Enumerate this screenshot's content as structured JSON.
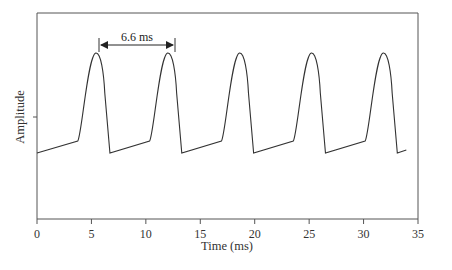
{
  "chart_data": {
    "type": "line",
    "title": "",
    "xlabel": "Time (ms)",
    "ylabel": "Amplitude",
    "xlim": [
      0,
      35
    ],
    "xticks": [
      0,
      5,
      10,
      15,
      20,
      25,
      30,
      35
    ],
    "xtick_labels": [
      "0",
      "5",
      "10",
      "15",
      "20",
      "25",
      "30",
      "35"
    ],
    "yticks_unlabeled": 1,
    "grid": false,
    "legend": null,
    "series": [
      {
        "name": "periodic pulse waveform",
        "period_ms": 6.6,
        "peak_times_ms": [
          5.4,
          12.0,
          18.6,
          25.2,
          31.8
        ],
        "trough_times_ms": [
          0.0,
          6.7,
          13.3,
          19.9,
          26.5,
          33.1
        ],
        "description": "Sawtooth-like rising ramp from trough, then rounded sharp peak and fast drop back to baseline"
      }
    ],
    "annotations": [
      {
        "text": "6.6 ms",
        "type": "double-arrow",
        "from_ms": 5.4,
        "to_ms": 12.0
      }
    ]
  },
  "labels": {
    "x_axis": "Time (ms)",
    "y_axis": "Amplitude",
    "period_annotation": "6.6 ms",
    "x_ticks": [
      "0",
      "5",
      "10",
      "15",
      "20",
      "25",
      "30",
      "35"
    ]
  }
}
